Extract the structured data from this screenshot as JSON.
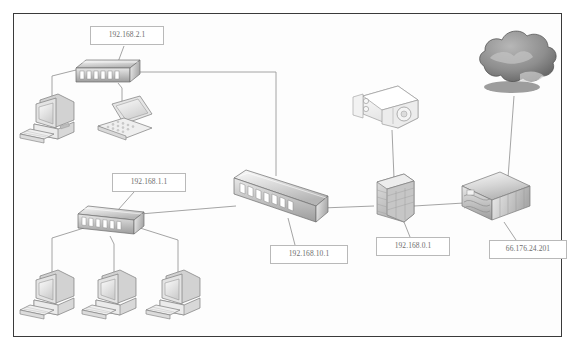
{
  "diagram": {
    "frame": {
      "border_color": "#3a3a3a",
      "background": "#fdfdfd"
    },
    "labels": [
      {
        "id": "lan2-switch-ip",
        "text": "192.168.2.1",
        "x": 90,
        "y": 26,
        "w": 74,
        "h": 18
      },
      {
        "id": "lan1-switch-ip",
        "text": "192.168.1.1",
        "x": 112,
        "y": 173,
        "w": 74,
        "h": 18
      },
      {
        "id": "core-switch-ip",
        "text": "192.168.10.1",
        "x": 270,
        "y": 245,
        "w": 78,
        "h": 18
      },
      {
        "id": "firewall-ip",
        "text": "192.168.0.1",
        "x": 376,
        "y": 237,
        "w": 74,
        "h": 18
      },
      {
        "id": "edge-router-ip",
        "text": "66.176.24.201",
        "x": 489,
        "y": 240,
        "w": 78,
        "h": 18
      }
    ],
    "nodes": [
      {
        "id": "cloud",
        "name": "internet-cloud",
        "label": "Internet Cloud",
        "x": 518,
        "y": 62
      },
      {
        "id": "server",
        "name": "server-appliance",
        "label": "Server Appliance",
        "x": 384,
        "y": 109
      },
      {
        "id": "firewall",
        "name": "firewall-brick",
        "label": "Firewall",
        "x": 394,
        "y": 197
      },
      {
        "id": "edge-router",
        "name": "edge-router",
        "label": "Edge Router",
        "x": 496,
        "y": 199
      },
      {
        "id": "core-switch",
        "name": "core-switch",
        "label": "Core Switch",
        "x": 278,
        "y": 196
      },
      {
        "id": "lan2-switch",
        "name": "lan2-switch",
        "label": "LAN 2 Switch",
        "x": 107,
        "y": 74
      },
      {
        "id": "lan1-switch",
        "name": "lan1-switch",
        "label": "LAN 1 Switch",
        "x": 111,
        "y": 221
      },
      {
        "id": "pc-top",
        "name": "workstation-top-left",
        "label": "Workstation",
        "x": 50,
        "y": 115
      },
      {
        "id": "laptop-top",
        "name": "laptop-top-left",
        "label": "Laptop",
        "x": 118,
        "y": 125
      },
      {
        "id": "pc-bottom-1",
        "name": "workstation-bottom-1",
        "label": "Workstation",
        "x": 50,
        "y": 291
      },
      {
        "id": "pc-bottom-2",
        "name": "workstation-bottom-2",
        "label": "Workstation",
        "x": 112,
        "y": 291
      },
      {
        "id": "pc-bottom-3",
        "name": "workstation-bottom-3",
        "label": "Workstation",
        "x": 176,
        "y": 291
      }
    ],
    "link_color": "#9a9a9a",
    "link_count": 12
  }
}
